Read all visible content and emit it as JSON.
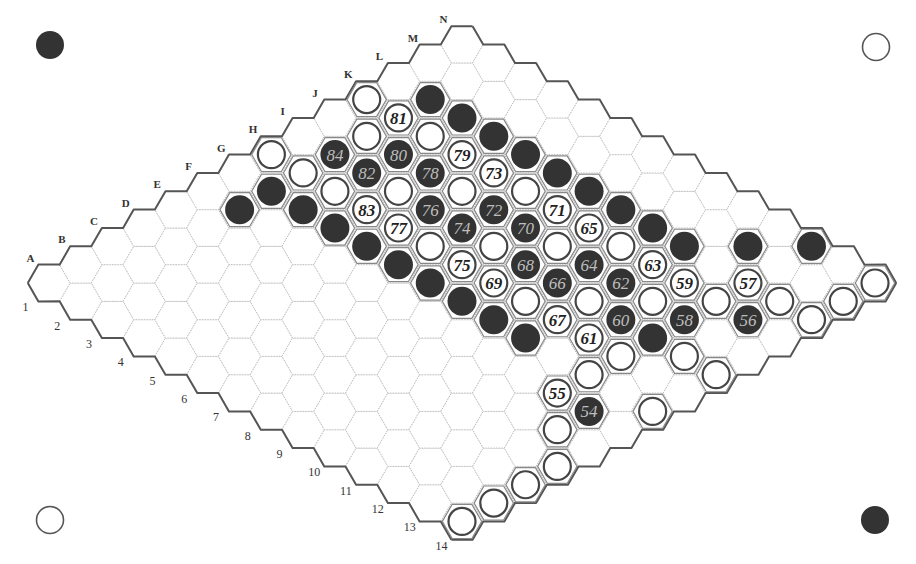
{
  "board": {
    "size": 14,
    "origin": {
      "x": 49,
      "y": 283
    },
    "step": {
      "dx": 31.77,
      "dy": 18.34
    },
    "hex_radius": 21.2,
    "letters": [
      "A",
      "B",
      "C",
      "D",
      "E",
      "F",
      "G",
      "H",
      "I",
      "J",
      "K",
      "L",
      "M",
      "N"
    ],
    "numbers": [
      "1",
      "2",
      "3",
      "4",
      "5",
      "6",
      "7",
      "8",
      "9",
      "10",
      "11",
      "12",
      "13",
      "14"
    ],
    "colors": {
      "black": "#333333",
      "white": "#ffffff",
      "grid": "#b8b8b8",
      "edge": "#555555"
    }
  },
  "corner_markers": [
    {
      "name": "top-left-black-marker",
      "color": "black",
      "x": 50,
      "y": 45
    },
    {
      "name": "top-right-white-marker",
      "color": "white",
      "x": 876,
      "y": 47
    },
    {
      "name": "bottom-left-white-marker",
      "color": "white",
      "x": 50,
      "y": 520
    },
    {
      "name": "bottom-right-black-marker",
      "color": "black",
      "x": 875,
      "y": 520
    }
  ],
  "stones": [
    {
      "cell": "K1",
      "color": "white"
    },
    {
      "cell": "K2",
      "color": "white",
      "move": "81"
    },
    {
      "cell": "L2",
      "color": "black"
    },
    {
      "cell": "L3",
      "color": "black"
    },
    {
      "cell": "L4",
      "color": "black"
    },
    {
      "cell": "L5",
      "color": "black"
    },
    {
      "cell": "L6",
      "color": "black"
    },
    {
      "cell": "L7",
      "color": "black"
    },
    {
      "cell": "L8",
      "color": "black"
    },
    {
      "cell": "L9",
      "color": "black"
    },
    {
      "cell": "L10",
      "color": "black"
    },
    {
      "cell": "J2",
      "color": "white"
    },
    {
      "cell": "K3",
      "color": "white"
    },
    {
      "cell": "J3",
      "color": "black",
      "move": "80"
    },
    {
      "cell": "K4",
      "color": "white",
      "move": "79"
    },
    {
      "cell": "I2",
      "color": "black",
      "move": "84"
    },
    {
      "cell": "I3",
      "color": "black",
      "move": "82"
    },
    {
      "cell": "J4",
      "color": "black",
      "move": "78"
    },
    {
      "cell": "K5",
      "color": "white",
      "move": "73"
    },
    {
      "cell": "H1",
      "color": "white"
    },
    {
      "cell": "H2",
      "color": "white"
    },
    {
      "cell": "G2",
      "color": "black"
    },
    {
      "cell": "F2",
      "color": "black"
    },
    {
      "cell": "G3",
      "color": "black"
    },
    {
      "cell": "H3",
      "color": "white"
    },
    {
      "cell": "I4",
      "color": "white"
    },
    {
      "cell": "J5",
      "color": "white"
    },
    {
      "cell": "K6",
      "color": "white"
    },
    {
      "cell": "H4",
      "color": "white",
      "move": "83"
    },
    {
      "cell": "I5",
      "color": "black",
      "move": "76"
    },
    {
      "cell": "J6",
      "color": "black",
      "move": "72"
    },
    {
      "cell": "K7",
      "color": "white",
      "move": "71"
    },
    {
      "cell": "G4",
      "color": "black"
    },
    {
      "cell": "H5",
      "color": "white",
      "move": "77"
    },
    {
      "cell": "I6",
      "color": "black",
      "move": "74"
    },
    {
      "cell": "J7",
      "color": "black",
      "move": "70"
    },
    {
      "cell": "K8",
      "color": "white",
      "move": "65"
    },
    {
      "cell": "G5",
      "color": "black"
    },
    {
      "cell": "H6",
      "color": "white"
    },
    {
      "cell": "I7",
      "color": "white"
    },
    {
      "cell": "J8",
      "color": "white"
    },
    {
      "cell": "K9",
      "color": "white"
    },
    {
      "cell": "G6",
      "color": "black"
    },
    {
      "cell": "H7",
      "color": "white",
      "move": "75"
    },
    {
      "cell": "I8",
      "color": "black",
      "move": "68"
    },
    {
      "cell": "J9",
      "color": "black",
      "move": "64"
    },
    {
      "cell": "K10",
      "color": "white",
      "move": "63"
    },
    {
      "cell": "G7",
      "color": "black"
    },
    {
      "cell": "H8",
      "color": "white",
      "move": "69"
    },
    {
      "cell": "I9",
      "color": "black",
      "move": "66"
    },
    {
      "cell": "J10",
      "color": "black",
      "move": "62"
    },
    {
      "cell": "K11",
      "color": "white",
      "move": "59"
    },
    {
      "cell": "L12",
      "color": "white",
      "move": "57"
    },
    {
      "cell": "M11",
      "color": "black"
    },
    {
      "cell": "N12",
      "color": "black"
    },
    {
      "cell": "N14",
      "color": "white"
    },
    {
      "cell": "G8",
      "color": "black"
    },
    {
      "cell": "H9",
      "color": "white"
    },
    {
      "cell": "I10",
      "color": "white"
    },
    {
      "cell": "J11",
      "color": "white"
    },
    {
      "cell": "K12",
      "color": "white"
    },
    {
      "cell": "L13",
      "color": "white"
    },
    {
      "cell": "M14",
      "color": "white"
    },
    {
      "cell": "G9",
      "color": "black"
    },
    {
      "cell": "H10",
      "color": "white",
      "move": "67"
    },
    {
      "cell": "I11",
      "color": "black",
      "move": "60"
    },
    {
      "cell": "J12",
      "color": "black",
      "move": "58"
    },
    {
      "cell": "K13",
      "color": "black",
      "move": "56"
    },
    {
      "cell": "L14",
      "color": "white"
    },
    {
      "cell": "G10",
      "color": "black"
    },
    {
      "cell": "H11",
      "color": "white",
      "move": "61"
    },
    {
      "cell": "I12",
      "color": "black"
    },
    {
      "cell": "H12",
      "color": "white"
    },
    {
      "cell": "I13",
      "color": "white"
    },
    {
      "cell": "I14",
      "color": "white"
    },
    {
      "cell": "G12",
      "color": "white"
    },
    {
      "cell": "F12",
      "color": "white",
      "move": "55"
    },
    {
      "cell": "F13",
      "color": "black",
      "move": "54"
    },
    {
      "cell": "G14",
      "color": "white"
    },
    {
      "cell": "E13",
      "color": "white"
    },
    {
      "cell": "D14",
      "color": "white"
    },
    {
      "cell": "C14",
      "color": "white"
    },
    {
      "cell": "B14",
      "color": "white"
    },
    {
      "cell": "A14",
      "color": "white"
    }
  ]
}
